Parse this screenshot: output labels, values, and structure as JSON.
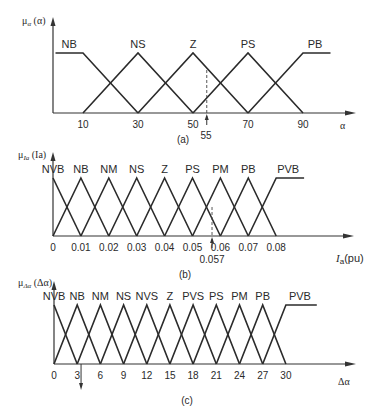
{
  "chart_data": [
    {
      "type": "line",
      "panel": "(a)",
      "title": "",
      "ylabel": "μα (α)",
      "xlabel": "α",
      "x_ticks": [
        10,
        30,
        50,
        70,
        90
      ],
      "xlim": [
        0,
        100
      ],
      "ylim": [
        0,
        1
      ],
      "marker": {
        "value": 55,
        "label": "55"
      },
      "series": [
        {
          "name": "NB",
          "points": [
            [
              0,
              1
            ],
            [
              10,
              1
            ],
            [
              30,
              0
            ]
          ]
        },
        {
          "name": "NS",
          "points": [
            [
              10,
              0
            ],
            [
              30,
              1
            ],
            [
              50,
              0
            ]
          ]
        },
        {
          "name": "Z",
          "points": [
            [
              30,
              0
            ],
            [
              50,
              1
            ],
            [
              70,
              0
            ]
          ]
        },
        {
          "name": "PS",
          "points": [
            [
              50,
              0
            ],
            [
              70,
              1
            ],
            [
              90,
              0
            ]
          ]
        },
        {
          "name": "PB",
          "points": [
            [
              70,
              0
            ],
            [
              90,
              1
            ],
            [
              100,
              1
            ]
          ]
        }
      ]
    },
    {
      "type": "line",
      "panel": "(b)",
      "ylabel": "μIa (Ia)",
      "xlabel": "Ia(pu)",
      "x_ticks": [
        0,
        0.01,
        0.02,
        0.03,
        0.04,
        0.05,
        0.06,
        0.07,
        0.08
      ],
      "x_tick_labels": [
        "0",
        "0.01",
        "0.02",
        "0.03",
        "0.04",
        "0.05",
        "0.06",
        "0.07",
        "0.08"
      ],
      "xlim": [
        0,
        0.1
      ],
      "ylim": [
        0,
        1
      ],
      "marker": {
        "value": 0.057,
        "label": "0.057"
      },
      "series": [
        {
          "name": "NVB",
          "points": [
            [
              0,
              1
            ],
            [
              0.01,
              0
            ]
          ]
        },
        {
          "name": "NB",
          "points": [
            [
              0,
              0
            ],
            [
              0.01,
              1
            ],
            [
              0.02,
              0
            ]
          ]
        },
        {
          "name": "NM",
          "points": [
            [
              0.01,
              0
            ],
            [
              0.02,
              1
            ],
            [
              0.03,
              0
            ]
          ]
        },
        {
          "name": "NS",
          "points": [
            [
              0.02,
              0
            ],
            [
              0.03,
              1
            ],
            [
              0.04,
              0
            ]
          ]
        },
        {
          "name": "Z",
          "points": [
            [
              0.03,
              0
            ],
            [
              0.04,
              1
            ],
            [
              0.05,
              0
            ]
          ]
        },
        {
          "name": "PS",
          "points": [
            [
              0.04,
              0
            ],
            [
              0.05,
              1
            ],
            [
              0.06,
              0
            ]
          ]
        },
        {
          "name": "PM",
          "points": [
            [
              0.05,
              0
            ],
            [
              0.06,
              1
            ],
            [
              0.07,
              0
            ]
          ]
        },
        {
          "name": "PB",
          "points": [
            [
              0.06,
              0
            ],
            [
              0.07,
              1
            ],
            [
              0.08,
              0
            ]
          ]
        },
        {
          "name": "PVB",
          "points": [
            [
              0.07,
              0
            ],
            [
              0.08,
              1
            ],
            [
              0.09,
              1
            ]
          ]
        }
      ]
    },
    {
      "type": "line",
      "panel": "(c)",
      "ylabel": "μΔα (Δα)",
      "xlabel": "Δα",
      "x_ticks": [
        0,
        3,
        6,
        9,
        12,
        15,
        18,
        21,
        24,
        27,
        30
      ],
      "xlim": [
        0,
        39
      ],
      "ylim": [
        0,
        1
      ],
      "marker": {
        "value": 3.5,
        "label": "",
        "direction": "down"
      },
      "series": [
        {
          "name": "NVB",
          "points": [
            [
              0,
              1
            ],
            [
              3,
              0
            ]
          ]
        },
        {
          "name": "NB",
          "points": [
            [
              0,
              0
            ],
            [
              3,
              1
            ],
            [
              6,
              0
            ]
          ]
        },
        {
          "name": "NM",
          "points": [
            [
              3,
              0
            ],
            [
              6,
              1
            ],
            [
              9,
              0
            ]
          ]
        },
        {
          "name": "NS",
          "points": [
            [
              6,
              0
            ],
            [
              9,
              1
            ],
            [
              12,
              0
            ]
          ]
        },
        {
          "name": "NVS",
          "points": [
            [
              9,
              0
            ],
            [
              12,
              1
            ],
            [
              15,
              0
            ]
          ]
        },
        {
          "name": "Z",
          "points": [
            [
              12,
              0
            ],
            [
              15,
              1
            ],
            [
              18,
              0
            ]
          ]
        },
        {
          "name": "PVS",
          "points": [
            [
              15,
              0
            ],
            [
              18,
              1
            ],
            [
              21,
              0
            ]
          ]
        },
        {
          "name": "PS",
          "points": [
            [
              18,
              0
            ],
            [
              21,
              1
            ],
            [
              24,
              0
            ]
          ]
        },
        {
          "name": "PM",
          "points": [
            [
              21,
              0
            ],
            [
              24,
              1
            ],
            [
              27,
              0
            ]
          ]
        },
        {
          "name": "PB",
          "points": [
            [
              24,
              0
            ],
            [
              27,
              1
            ],
            [
              30,
              0
            ]
          ]
        },
        {
          "name": "PVB",
          "points": [
            [
              27,
              0
            ],
            [
              30,
              1
            ],
            [
              34,
              1
            ]
          ]
        }
      ]
    }
  ],
  "layout": [
    {
      "x0": 55.5,
      "scale": 2.75,
      "axisX": 53,
      "base": 113,
      "peak": 53,
      "top": 17,
      "end": 356,
      "tickY": 128,
      "labelY": 48,
      "captionX": 183,
      "captionY": 143,
      "xlabelX": 340,
      "xlabelY": 129,
      "ylabelX": 22,
      "ylabelY": 24,
      "markerLabelX": 206,
      "markerLabelY": 139,
      "markerTop": 70,
      "labelOffsets": {
        "NB": [
          -12,
          0
        ],
        "PB": [
          12,
          0
        ]
      }
    },
    {
      "x0": 53,
      "scale": 2790,
      "axisX": 53,
      "base": 236,
      "peak": 178,
      "top": 152,
      "end": 354,
      "tickY": 251,
      "labelY": 173,
      "captionX": 185,
      "captionY": 278,
      "xlabelX": 336,
      "xlabelY": 262,
      "ylabelX": 18,
      "ylabelY": 158,
      "markerLabelX": 212,
      "markerLabelY": 263,
      "markerTop": 207,
      "labelOffsets": {
        "PVB": [
          12,
          0
        ]
      }
    },
    {
      "x0": 54,
      "scale": 7.73,
      "axisX": 54,
      "base": 364,
      "peak": 305,
      "top": 281,
      "end": 356,
      "tickY": 379,
      "labelY": 300,
      "captionX": 187,
      "captionY": 404,
      "xlabelX": 338,
      "xlabelY": 385,
      "ylabelX": 18,
      "ylabelY": 286,
      "markerLabelX": 0,
      "markerLabelY": 0,
      "markerTop": 0,
      "labelOffsets": {
        "PVB": [
          14,
          0
        ]
      }
    }
  ],
  "captions": [
    "(a)",
    "(b)",
    "(c)"
  ],
  "axis_labels": {
    "a": {
      "y_main": "μ",
      "y_sub": "α",
      "y_arg": " (α)",
      "x": "α"
    },
    "b": {
      "y_main": "μ",
      "y_sub": "Ia",
      "y_arg": " (Ia)",
      "x_main": "I",
      "x_sub": "a",
      "x_unit": "(pu)"
    },
    "c": {
      "y_main": "μ",
      "y_sub": "Δα",
      "y_arg": " (Δα)",
      "x": "Δα"
    }
  },
  "colors": {
    "line": "#2b2b2b",
    "text": "#2a2a2a",
    "background": "#ffffff"
  }
}
